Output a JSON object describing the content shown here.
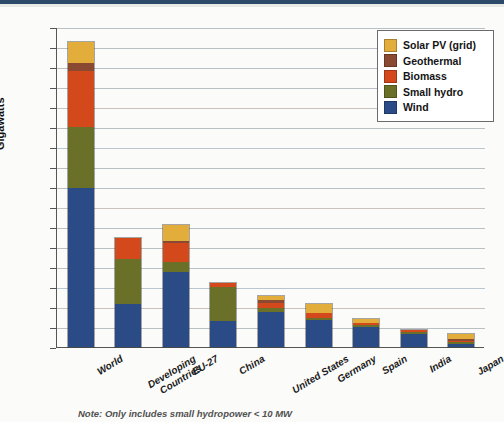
{
  "chart_data": {
    "type": "bar",
    "title": "",
    "subtype": "stacked-bar",
    "xlabel": "",
    "ylabel": "Gigawatts",
    "ylim": [
      0,
      320
    ],
    "ytick_step": 20,
    "yticks": [
      0,
      20,
      40,
      60,
      80,
      100,
      120,
      140,
      160,
      180,
      200,
      220,
      240,
      260,
      280,
      300,
      320
    ],
    "grid": true,
    "legend_position": "top-right",
    "categories": [
      "World",
      "Developing Countries",
      "EU-27",
      "China",
      "United States",
      "Germany",
      "Spain",
      "India",
      "Japan"
    ],
    "category_lines": [
      [
        "World"
      ],
      [
        "Developing",
        "Countries"
      ],
      [
        "EU-27"
      ],
      [
        "China"
      ],
      [
        "United States"
      ],
      [
        "Germany"
      ],
      [
        "Spain"
      ],
      [
        "India"
      ],
      [
        "Japan"
      ]
    ],
    "series": [
      {
        "name": "Wind",
        "color": "#2b4b86",
        "values": [
          159,
          43,
          75,
          26,
          35,
          27,
          20,
          13,
          3
        ]
      },
      {
        "name": "Small hydro",
        "color": "#6b7029",
        "values": [
          61,
          45,
          10,
          34,
          4,
          2,
          2,
          2,
          1
        ]
      },
      {
        "name": "Biomass",
        "color": "#d4491c",
        "values": [
          56,
          21,
          19,
          4,
          5,
          5,
          1,
          2,
          1
        ]
      },
      {
        "name": "Geothermal",
        "color": "#8a4a31",
        "values": [
          8,
          0,
          1,
          0,
          3,
          0,
          0,
          0,
          1
        ]
      },
      {
        "name": "Solar PV (grid)",
        "color": "#e2ad3b",
        "values": [
          21,
          0,
          16,
          0,
          4,
          9,
          4,
          0,
          5
        ]
      }
    ],
    "totals": [
      305,
      109,
      121,
      64,
      51,
      43,
      27,
      17,
      11
    ],
    "legend_entries": [
      {
        "label": "Solar PV (grid)",
        "color": "#e2ad3b"
      },
      {
        "label": "Geothermal",
        "color": "#8a4a31"
      },
      {
        "label": "Biomass",
        "color": "#d4491c"
      },
      {
        "label": "Small hydro",
        "color": "#6b7029"
      },
      {
        "label": "Wind",
        "color": "#2b4b86"
      }
    ],
    "note": "Note: Only includes small hydropower < 10 MW"
  }
}
